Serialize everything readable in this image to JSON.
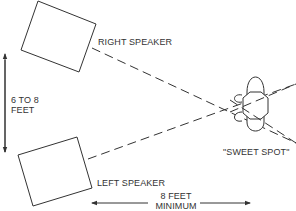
{
  "diagram": {
    "colors": {
      "line": "#333333",
      "background": "#ffffff"
    },
    "labels": {
      "right_speaker": "RIGHT SPEAKER",
      "left_speaker": "LEFT SPEAKER",
      "speaker_spacing_line1": "6 TO 8",
      "speaker_spacing_line2": "FEET",
      "sweet_spot": "\"SWEET SPOT\"",
      "listening_distance_line1": "8 FEET",
      "listening_distance_line2": "MINIMUM"
    },
    "elements": [
      {
        "name": "right-speaker",
        "shape": "rotated-rectangle"
      },
      {
        "name": "left-speaker",
        "shape": "rotated-rectangle"
      },
      {
        "name": "listener-head",
        "shape": "head-top-view"
      },
      {
        "name": "right-speaker-sound-path",
        "style": "dashed"
      },
      {
        "name": "left-speaker-sound-path",
        "style": "dashed"
      },
      {
        "name": "speaker-spacing-arrow",
        "style": "double-arrow-vertical"
      },
      {
        "name": "listening-distance-arrow",
        "style": "double-arrow-horizontal"
      }
    ]
  }
}
